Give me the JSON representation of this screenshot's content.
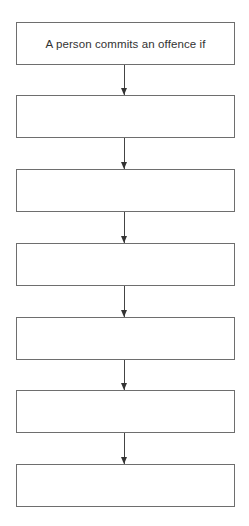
{
  "flowchart": {
    "boxes": [
      {
        "text": "A person commits an offence if"
      },
      {
        "text": ""
      },
      {
        "text": ""
      },
      {
        "text": ""
      },
      {
        "text": ""
      },
      {
        "text": ""
      },
      {
        "text": ""
      }
    ],
    "connector": "down-arrow",
    "line_color": "#6e6e6e"
  }
}
